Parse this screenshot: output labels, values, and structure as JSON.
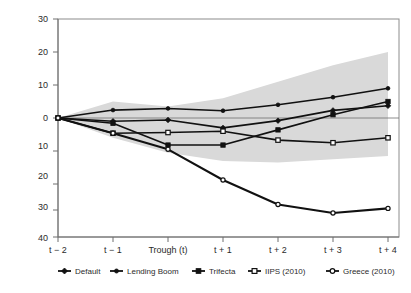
{
  "chart_data": {
    "type": "line",
    "title": "",
    "subtitle": "",
    "xlabel": "",
    "ylabel": "",
    "grid": false,
    "legend_position": "bottom",
    "categories": [
      "t − 2",
      "t − 1",
      "Trough (t)",
      "t + 1",
      "t + 2",
      "t + 3",
      "t + 4"
    ],
    "x_tick_labels": [
      "t − 2",
      "t − 1",
      "Trough (t)",
      "t + 1",
      "t + 2",
      "t + 3",
      "t + 4"
    ],
    "y_tick_labels": [
      "30",
      "20",
      "10",
      "0",
      "10",
      "20",
      "30",
      "40"
    ],
    "y_tick_values": [
      30,
      20,
      10,
      0,
      -10,
      -20,
      -30,
      -40
    ],
    "ylim": [
      -40,
      30
    ],
    "series": [
      {
        "name": "Default",
        "marker": "filled-diamond",
        "values": [
          0,
          -1.0,
          -0.6,
          -3.0,
          -0.8,
          2.3,
          3.7
        ]
      },
      {
        "name": "Lending Boom",
        "marker": "filled-circle",
        "values": [
          0,
          2.4,
          2.9,
          2.2,
          4.0,
          6.3,
          9.0
        ]
      },
      {
        "name": "Trifecta",
        "marker": "filled-square",
        "values": [
          0,
          -1.6,
          -8.2,
          -8.2,
          -3.6,
          1.0,
          5.0
        ]
      },
      {
        "name": "IIPS (2010)",
        "marker": "open-square",
        "values": [
          0,
          -4.6,
          -4.4,
          -4.0,
          -6.7,
          -7.5,
          -6.0
        ]
      },
      {
        "name": "Greece (2010)",
        "marker": "open-circle",
        "values": [
          0,
          -4.6,
          -9.5,
          -18.8,
          -26.2,
          -28.8,
          -27.4
        ]
      }
    ],
    "band": {
      "name": "confidence-band",
      "color": "#d9d9d9",
      "upper": [
        0,
        5.0,
        3.5,
        6.0,
        11.0,
        16.0,
        20.0
      ],
      "lower": [
        0,
        -6.0,
        -10.5,
        -13.0,
        -13.5,
        -12.5,
        -11.5
      ]
    }
  },
  "legend": {
    "items": [
      {
        "label": "Default",
        "marker": "filled-diamond"
      },
      {
        "label": "Lending Boom",
        "marker": "filled-circle"
      },
      {
        "label": "Trifecta",
        "marker": "filled-square"
      },
      {
        "label": "IIPS (2010)",
        "marker": "open-square"
      },
      {
        "label": "Greece (2010)",
        "marker": "open-circle"
      }
    ]
  }
}
